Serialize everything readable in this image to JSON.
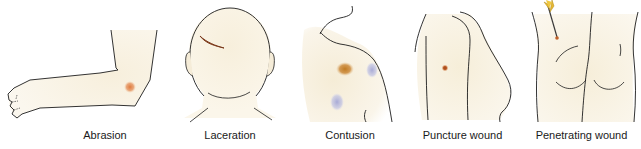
{
  "figure": {
    "skin_color": "#f7efdc",
    "outline_color": "#1c1c1c",
    "panels": [
      {
        "id": "abrasion",
        "label": "Abrasion",
        "body_region": "arm / elbow",
        "mark_color": "#e07a3c"
      },
      {
        "id": "laceration",
        "label": "Laceration",
        "body_region": "back of head",
        "mark_color": "#b5582a"
      },
      {
        "id": "contusion",
        "label": "Contusion",
        "body_region": "shoulder / back",
        "mark_color": "#c98a2e",
        "secondary_mark_color": "#aab0d8"
      },
      {
        "id": "puncture",
        "label": "Puncture wound",
        "body_region": "torso side",
        "mark_color": "#c0622c"
      },
      {
        "id": "penetrating",
        "label": "Penetrating wound",
        "body_region": "buttocks",
        "mark_color": "#e8b830"
      }
    ]
  }
}
